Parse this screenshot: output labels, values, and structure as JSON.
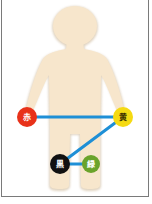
{
  "diagram": {
    "figure": {
      "fill": "#f7e6cc",
      "shadow": "#e2d2bb"
    },
    "connector_color": "#1e8fd6",
    "points": [
      {
        "id": "red",
        "label": "赤",
        "color": "#e8321a",
        "text_color": "#ffffff",
        "x": 27,
        "y": 117
      },
      {
        "id": "yellow",
        "label": "黄",
        "color": "#f5da12",
        "text_color": "#3a2e00",
        "x": 123,
        "y": 117
      },
      {
        "id": "black",
        "label": "黒",
        "color": "#111111",
        "text_color": "#ffffff",
        "x": 60,
        "y": 164
      },
      {
        "id": "green",
        "label": "緑",
        "color": "#6aa32a",
        "text_color": "#ffffff",
        "x": 91,
        "y": 164
      }
    ],
    "connections": [
      [
        "red",
        "yellow"
      ],
      [
        "yellow",
        "black"
      ],
      [
        "black",
        "green"
      ]
    ]
  }
}
